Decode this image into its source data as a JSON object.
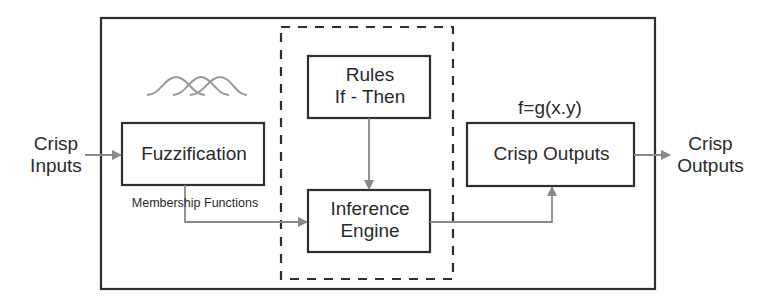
{
  "diagram": {
    "inputs_label": [
      "Crisp",
      "Inputs"
    ],
    "outputs_label": [
      "Crisp",
      "Outputs"
    ],
    "nodes": {
      "fuzzification": {
        "label": "Fuzzification"
      },
      "rules": {
        "label_line1": "Rules",
        "label_line2": "If - Then"
      },
      "inference": {
        "label_line1": "Inference",
        "label_line2": "Engine"
      },
      "crisp_outputs": {
        "label": "Crisp Outputs"
      }
    },
    "annotations": {
      "membership_functions": "Membership Functions",
      "output_function": "f=g(x.y)"
    },
    "membership_curve_count": 3,
    "edges": [
      {
        "from": "crisp-inputs",
        "to": "fuzzification"
      },
      {
        "from": "fuzzification",
        "to": "inference",
        "label": "Membership Functions"
      },
      {
        "from": "rules",
        "to": "inference"
      },
      {
        "from": "inference",
        "to": "crisp_outputs"
      },
      {
        "from": "crisp_outputs",
        "to": "crisp-outputs-external"
      }
    ],
    "colors": {
      "box_stroke": "#2e2e2e",
      "arrow": "#8a8a8a",
      "curve": "#9a9a9a"
    }
  }
}
